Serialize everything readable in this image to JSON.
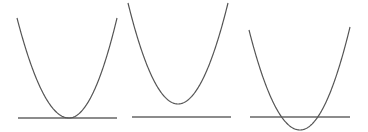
{
  "diagram": {
    "stroke_color": "#555555",
    "axis_color": "#666666",
    "panels": [
      {
        "name": "one-root",
        "axis": {
          "x1": 18,
          "x2": 117,
          "y": 118
        },
        "parabola": {
          "left": [
            17,
            18
          ],
          "vertex": [
            69,
            118
          ],
          "right": [
            117,
            18
          ]
        }
      },
      {
        "name": "no-real-roots",
        "axis": {
          "x1": 132,
          "x2": 231,
          "y": 117
        },
        "parabola": {
          "left": [
            128,
            3
          ],
          "vertex": [
            178,
            104
          ],
          "right": [
            228,
            3
          ]
        }
      },
      {
        "name": "two-roots",
        "axis": {
          "x1": 250,
          "x2": 350,
          "y": 117
        },
        "parabola": {
          "left": [
            249,
            30
          ],
          "vertex": [
            300,
            130
          ],
          "right": [
            350,
            27
          ]
        }
      }
    ]
  }
}
